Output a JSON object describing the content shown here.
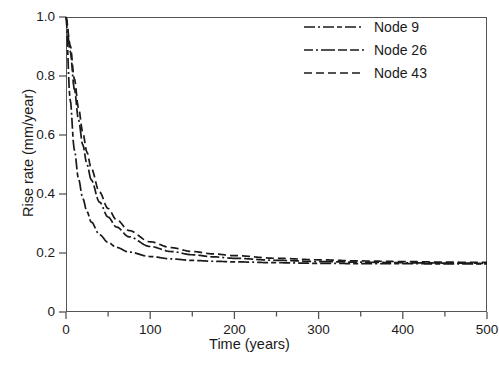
{
  "chart_data": {
    "type": "line",
    "title": "",
    "xlabel": "Time (years)",
    "ylabel": "Rise rate (mm/year)",
    "xlim": [
      0,
      500
    ],
    "ylim": [
      0,
      1.0
    ],
    "xticks": [
      0,
      100,
      200,
      300,
      400,
      500
    ],
    "xtick_labels": [
      "0",
      "100",
      "200",
      "300",
      "400",
      "500"
    ],
    "xminor_ticks": [
      50,
      150,
      250,
      350,
      450
    ],
    "yticks": [
      0,
      0.2,
      0.4,
      0.6,
      0.8,
      1.0
    ],
    "ytick_labels": [
      "0",
      "0.2",
      "0.4",
      "0.6",
      "0.8",
      "1.0"
    ],
    "grid": false,
    "legend_position": "top-right",
    "x": [
      0,
      5,
      10,
      15,
      20,
      25,
      30,
      40,
      50,
      60,
      75,
      100,
      125,
      150,
      175,
      200,
      250,
      300,
      350,
      400,
      450,
      500
    ],
    "series": [
      {
        "name": "Node 9",
        "dash": "dash-dot-dash",
        "asymptote": 0.163,
        "values": [
          1.0,
          0.72,
          0.55,
          0.45,
          0.385,
          0.34,
          0.305,
          0.262,
          0.236,
          0.219,
          0.203,
          0.188,
          0.18,
          0.175,
          0.172,
          0.17,
          0.167,
          0.165,
          0.164,
          0.164,
          0.163,
          0.163
        ]
      },
      {
        "name": "Node 26",
        "dash": "dash-dot",
        "asymptote": 0.165,
        "values": [
          1.0,
          0.885,
          0.755,
          0.65,
          0.566,
          0.5,
          0.448,
          0.372,
          0.322,
          0.288,
          0.255,
          0.222,
          0.205,
          0.194,
          0.187,
          0.182,
          0.175,
          0.171,
          0.169,
          0.167,
          0.166,
          0.165
        ]
      },
      {
        "name": "Node 43",
        "dash": "dashed",
        "asymptote": 0.168,
        "values": [
          1.0,
          0.905,
          0.79,
          0.69,
          0.608,
          0.541,
          0.487,
          0.406,
          0.351,
          0.313,
          0.276,
          0.238,
          0.218,
          0.205,
          0.197,
          0.191,
          0.182,
          0.177,
          0.173,
          0.171,
          0.169,
          0.168
        ]
      }
    ]
  },
  "legend": {
    "items": [
      {
        "label": "Node 9"
      },
      {
        "label": "Node 26"
      },
      {
        "label": "Node 43"
      }
    ]
  }
}
